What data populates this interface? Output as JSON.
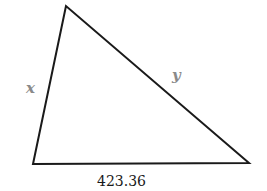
{
  "diagram": {
    "type": "triangle",
    "vertices": {
      "top": [
        66,
        6
      ],
      "bottom_left": [
        33,
        164
      ],
      "bottom_right": [
        249,
        163
      ]
    },
    "sides": {
      "left": {
        "label": "x"
      },
      "right": {
        "label": "y"
      },
      "bottom": {
        "label": "423.36"
      }
    },
    "colors": {
      "stroke": "#1a1a1a",
      "variable_label": "#8a8a8a",
      "value_label": "#1a1a1a"
    }
  }
}
